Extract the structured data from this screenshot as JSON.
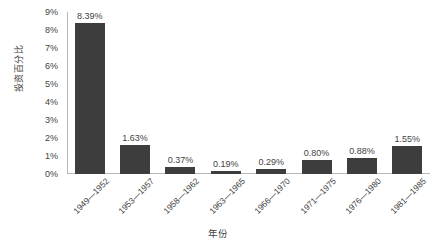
{
  "chart_data": {
    "type": "bar",
    "title": "",
    "xlabel": "年份",
    "ylabel": "投资百分比",
    "categories": [
      "1949—1952",
      "1953—1957",
      "1958—1962",
      "1963—1965",
      "1966—1970",
      "1971—1975",
      "1976—1980",
      "1981—1985"
    ],
    "values": [
      8.39,
      1.63,
      0.37,
      0.19,
      0.29,
      0.8,
      0.88,
      1.55
    ],
    "data_labels": [
      "8.39%",
      "1.63%",
      "0.37%",
      "0.19%",
      "0.29%",
      "0.80%",
      "0.88%",
      "1.55%"
    ],
    "ylim": [
      0,
      9
    ],
    "ytick_labels": [
      "0%",
      "1%",
      "2%",
      "3%",
      "4%",
      "5%",
      "6%",
      "7%",
      "8%",
      "9%"
    ],
    "ytick_values": [
      0,
      1,
      2,
      3,
      4,
      5,
      6,
      7,
      8,
      9
    ],
    "grid": false,
    "legend": null,
    "bar_color": "#3d3d3d",
    "axis_color": "#b8b8b8",
    "text_color": "#3f3f3f",
    "background": "#ffffff"
  }
}
